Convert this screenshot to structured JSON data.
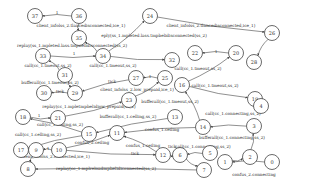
{
  "diagram": {
    "type": "state-machine",
    "nodes": [
      {
        "id": "37",
        "x": 35,
        "y": 16
      },
      {
        "id": "36",
        "x": 79,
        "y": 16
      },
      {
        "id": "35",
        "x": 79,
        "y": 38
      },
      {
        "id": "34",
        "x": 103,
        "y": 56
      },
      {
        "id": "33",
        "x": 43,
        "y": 56
      },
      {
        "id": "31",
        "x": 65,
        "y": 75
      },
      {
        "id": "30",
        "x": 44,
        "y": 93
      },
      {
        "id": "29",
        "x": 75,
        "y": 93
      },
      {
        "id": "27",
        "x": 136,
        "y": 78
      },
      {
        "id": "25",
        "x": 165,
        "y": 78
      },
      {
        "id": "24",
        "x": 150,
        "y": 16
      },
      {
        "id": "26",
        "x": 272,
        "y": 33
      },
      {
        "id": "28",
        "x": 254,
        "y": 62
      },
      {
        "id": "22",
        "x": 195,
        "y": 53
      },
      {
        "id": "20",
        "x": 236,
        "y": 53
      },
      {
        "id": "32",
        "x": 172,
        "y": 60
      },
      {
        "id": "23",
        "x": 129,
        "y": 100
      },
      {
        "id": "21",
        "x": 58,
        "y": 118
      },
      {
        "id": "18",
        "x": 23,
        "y": 117
      },
      {
        "id": "16",
        "x": 182,
        "y": 85
      },
      {
        "id": "19",
        "x": 255,
        "y": 99
      },
      {
        "id": "4",
        "x": 261,
        "y": 106
      },
      {
        "id": "15",
        "x": 89,
        "y": 134
      },
      {
        "id": "13",
        "x": 175,
        "y": 117
      },
      {
        "id": "14",
        "x": 203,
        "y": 127
      },
      {
        "id": "11",
        "x": 117,
        "y": 133
      },
      {
        "id": "17",
        "x": 21,
        "y": 150
      },
      {
        "id": "9",
        "x": 36,
        "y": 150
      },
      {
        "id": "10",
        "x": 59,
        "y": 150
      },
      {
        "id": "8",
        "x": 28,
        "y": 169
      },
      {
        "id": "3",
        "x": 254,
        "y": 126
      },
      {
        "id": "12",
        "x": 163,
        "y": 155
      },
      {
        "id": "6",
        "x": 180,
        "y": 155
      },
      {
        "id": "5",
        "x": 210,
        "y": 153
      },
      {
        "id": "7",
        "x": 204,
        "y": 170
      },
      {
        "id": "1",
        "x": 225,
        "y": 162
      },
      {
        "id": "2",
        "x": 250,
        "y": 157
      },
      {
        "id": "0",
        "x": 272,
        "y": 162
      }
    ],
    "edges": [
      {
        "from": "36",
        "to": "37",
        "label": "1",
        "lx": 57,
        "ly": 14
      },
      {
        "from": "36",
        "to": "35",
        "label": "client_infolss_2.tlancedisconnected,ice_1)",
        "lx": 81,
        "ly": 27
      },
      {
        "from": "34",
        "to": "35",
        "label": "replay(ss_1.mpleted.lass.tmpbelidisconnected(ss_2)",
        "lx": 72,
        "ly": 47
      },
      {
        "from": "24",
        "to": "26",
        "label": "client_infolss_2.tlancedisconnected,ice_1)",
        "lx": 211,
        "ly": 27
      },
      {
        "from": "34",
        "to": "24",
        "label": "eply(ss_1.mpleted.lass.tmpbelidisconnected(ss_2)",
        "lx": 154,
        "ly": 37
      },
      {
        "from": "33",
        "to": "34",
        "label": "1",
        "lx": 74,
        "ly": 55
      },
      {
        "from": "31",
        "to": "33",
        "label": "call(cc_1.tmeout,ss_2)",
        "lx": 48,
        "ly": 67
      },
      {
        "from": "34",
        "to": "32",
        "label": "call(cc_1.tmeout,ss_2)",
        "lx": 113,
        "ly": 67
      },
      {
        "from": "20",
        "to": "22",
        "label": "1",
        "lx": 216,
        "ly": 53
      },
      {
        "from": "16",
        "to": "20",
        "label": "call(cc_1.tmeout,ss_2)",
        "lx": 198,
        "ly": 70
      },
      {
        "from": "26",
        "to": "28",
        "label": "",
        "lx": 0,
        "ly": 0
      },
      {
        "from": "31",
        "to": "29",
        "label": "bufferall(cc_1.tmeout,ss_2)",
        "lx": 50,
        "ly": 84
      },
      {
        "from": "29",
        "to": "30",
        "label": "tick",
        "lx": 60,
        "ly": 93
      },
      {
        "from": "27",
        "to": "29",
        "label": "tick",
        "lx": 112,
        "ly": 83
      },
      {
        "from": "25",
        "to": "27",
        "label": "1",
        "lx": 150,
        "ly": 78
      },
      {
        "from": "16",
        "to": "19",
        "label": "call(cc_1.tmeout,ss_2)",
        "lx": 215,
        "ly": 87
      },
      {
        "from": "23",
        "to": "25",
        "label": "client_infolss_2.low_prepaid,ice_1)",
        "lx": 137,
        "ly": 91
      },
      {
        "from": "21",
        "to": "23",
        "label": "replay(cc_1.mpletmpbelidiow_prepaid(ss_2)",
        "lx": 89,
        "ly": 108
      },
      {
        "from": "14",
        "to": "16",
        "label": "bufferall(cc_1.tmeout,ss_2)",
        "lx": 170,
        "ly": 103
      },
      {
        "from": "18",
        "to": "21",
        "label": "1",
        "lx": 39,
        "ly": 117
      },
      {
        "from": "15",
        "to": "18",
        "label": "call(cc_1.celling,ss_2)",
        "lx": 60,
        "ly": 126
      },
      {
        "from": "13",
        "to": "15",
        "label": "bufferall(cc_1.celling,ss_2)",
        "lx": 128,
        "ly": 118
      },
      {
        "from": "14",
        "to": "11",
        "label": "confus_1.ceiling",
        "lx": 162,
        "ly": 131
      },
      {
        "from": "15",
        "to": "17",
        "label": "call(cc_1.celling,ss_2)",
        "lx": 38,
        "ly": 136
      },
      {
        "from": "10",
        "to": "11",
        "label": "confus_2.ceiling",
        "lx": 92,
        "ly": 144
      },
      {
        "from": "12",
        "to": "11",
        "label": "confus_1.ceiling",
        "lx": 143,
        "ly": 147
      },
      {
        "from": "10",
        "to": "9",
        "label": "1",
        "lx": 48,
        "ly": 150
      },
      {
        "from": "10",
        "to": "12",
        "label": "tick",
        "lx": 135,
        "ly": 155
      },
      {
        "from": "9",
        "to": "8",
        "label": "client_infolss_2.connected,ice_1)",
        "lx": 55,
        "ly": 158
      },
      {
        "from": "7",
        "to": "8",
        "label": "replay(cc_1.mplreloadmpbelidiconnected(ss_2)",
        "lx": 106,
        "ly": 170
      },
      {
        "from": "19",
        "to": "4",
        "label": "call(cc_1.connecting,ss_2)",
        "lx": 233,
        "ly": 115
      },
      {
        "from": "3",
        "to": "14",
        "label": "bufferall(cc_1.connecting,ss_2)",
        "lx": 232,
        "ly": 139
      },
      {
        "from": "5",
        "to": "6",
        "label": "call(cc_1.connecting,ss_2)",
        "lx": 203,
        "ly": 148
      },
      {
        "from": "6",
        "to": "7",
        "label": "",
        "lx": 0,
        "ly": 0
      },
      {
        "from": "12",
        "to": "6",
        "label": "tick",
        "lx": 172,
        "ly": 148
      },
      {
        "from": "1",
        "to": "2",
        "label": "",
        "lx": 0,
        "ly": 0
      },
      {
        "from": "2",
        "to": "3",
        "label": "",
        "lx": 0,
        "ly": 0
      },
      {
        "from": "0",
        "to": "1",
        "label": "confus_2.connecting",
        "lx": 254,
        "ly": 176
      }
    ]
  }
}
